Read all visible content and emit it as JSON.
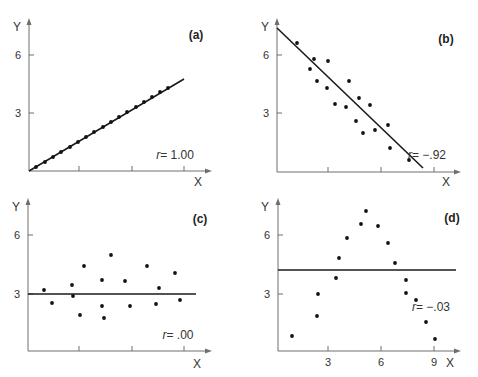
{
  "chart_data": [
    {
      "id": "a",
      "type": "scatter",
      "panel_label": "(a)",
      "xlabel": "X",
      "ylabel": "Y",
      "yticks": [
        "3",
        "6"
      ],
      "xticks": [
        "",
        "",
        ""
      ],
      "r_label": "r",
      "r_value": "= 1.00",
      "correlation": 1.0,
      "fit_line": {
        "x": [
          0,
          8.8
        ],
        "y": [
          0,
          4.75
        ]
      },
      "points": {
        "x": [
          0.4,
          0.9,
          1.4,
          1.9,
          2.4,
          2.9,
          3.4,
          3.9,
          4.4,
          4.9,
          5.4,
          5.9,
          6.4,
          6.9,
          7.4,
          7.9
        ],
        "y": [
          0.2,
          0.5,
          0.75,
          1.0,
          1.3,
          1.55,
          1.8,
          2.1,
          2.35,
          2.6,
          2.9,
          3.15,
          3.4,
          3.7,
          3.95,
          4.2
        ]
      },
      "geom": {
        "ox": 29,
        "oy": 171,
        "xaxis_end": 212,
        "yaxis_top": 18,
        "xtick_px": [
          79,
          132,
          184
        ],
        "ytick_px": [
          113,
          55
        ],
        "line": [
          29,
          171,
          184,
          79
        ],
        "dots": [
          [
            36,
            167
          ],
          [
            45,
            162
          ],
          [
            53,
            157
          ],
          [
            61,
            152
          ],
          [
            70,
            147
          ],
          [
            78,
            142
          ],
          [
            86,
            137
          ],
          [
            94,
            132
          ],
          [
            103,
            127
          ],
          [
            111,
            122
          ],
          [
            119,
            117
          ],
          [
            127,
            112
          ],
          [
            136,
            107
          ],
          [
            144,
            102
          ],
          [
            152,
            97
          ],
          [
            160,
            92
          ],
          [
            168,
            88
          ]
        ],
        "panel_label_xy": [
          196,
          39
        ],
        "r_xy": [
          175,
          159
        ],
        "xlabel_xy": [
          198,
          186
        ],
        "ylabel_xy": [
          17,
          31
        ]
      }
    },
    {
      "id": "b",
      "type": "scatter",
      "panel_label": "(b)",
      "xlabel": "X",
      "ylabel": "Y",
      "yticks": [
        "3",
        "6"
      ],
      "xticks": [
        "",
        "",
        ""
      ],
      "r_label": "r",
      "r_value": "= −.92",
      "correlation": -0.92,
      "fit_line": {
        "x": [
          0,
          8.6
        ],
        "y": [
          7.4,
          0.4
        ]
      },
      "points": {
        "x": [
          1.1,
          2.1,
          1.8,
          2.8,
          2.3,
          2.8,
          4.1,
          3.2,
          3.8,
          4.6,
          4.5,
          5.2,
          5.0,
          5.6,
          6.6,
          6.7,
          7.7
        ],
        "y": [
          6.6,
          5.8,
          5.3,
          5.7,
          4.7,
          4.3,
          4.7,
          3.5,
          3.3,
          3.8,
          2.6,
          3.4,
          2.0,
          2.2,
          2.4,
          1.2,
          0.6
        ]
      },
      "geom": {
        "ox": 277,
        "oy": 172,
        "xaxis_end": 461,
        "yaxis_top": 18,
        "xtick_px": [
          328,
          381,
          434
        ],
        "ytick_px": [
          113,
          55
        ],
        "line": [
          277,
          28,
          423,
          168
        ],
        "dots": [
          [
            297,
            43
          ],
          [
            314,
            59
          ],
          [
            310,
            69
          ],
          [
            328,
            61
          ],
          [
            317,
            81
          ],
          [
            327,
            88
          ],
          [
            349,
            81
          ],
          [
            335,
            104
          ],
          [
            346,
            107
          ],
          [
            359,
            98
          ],
          [
            356,
            121
          ],
          [
            370,
            105
          ],
          [
            363,
            133
          ],
          [
            375,
            130
          ],
          [
            388,
            125
          ],
          [
            390,
            148
          ],
          [
            409,
            160
          ]
        ],
        "panel_label_xy": [
          446,
          43
        ],
        "r_xy": [
          427,
          159
        ],
        "xlabel_xy": [
          446,
          186
        ],
        "ylabel_xy": [
          265,
          31
        ]
      }
    },
    {
      "id": "c",
      "type": "scatter",
      "panel_label": "(c)",
      "xlabel": "X",
      "ylabel": "Y",
      "yticks": [
        "3",
        "6"
      ],
      "xticks": [
        "",
        "",
        ""
      ],
      "r_label": "r",
      "r_value": "= .00",
      "correlation": 0.0,
      "fit_line": {
        "x": [
          0,
          9.5
        ],
        "y": [
          3.0,
          3.0
        ]
      },
      "points": {
        "x": [
          0.9,
          1.3,
          2.5,
          2.5,
          2.9,
          2.8,
          4.0,
          4.0,
          4.1,
          4.5,
          5.3,
          5.5,
          6.5,
          7.0,
          7.2,
          8.1,
          8.5
        ],
        "y": [
          3.2,
          2.5,
          3.5,
          2.9,
          4.4,
          1.9,
          3.7,
          2.4,
          1.8,
          5.0,
          3.7,
          2.4,
          4.4,
          2.5,
          3.3,
          4.0,
          2.7
        ]
      },
      "geom": {
        "ox": 28,
        "oy": 351,
        "xaxis_end": 212,
        "yaxis_top": 198,
        "xtick_px": [
          79,
          132,
          184
        ],
        "ytick_px": [
          294,
          235
        ],
        "line": [
          28,
          294,
          196,
          294
        ],
        "dots": [
          [
            44,
            290
          ],
          [
            52,
            303
          ],
          [
            72,
            285
          ],
          [
            73,
            296
          ],
          [
            84,
            266
          ],
          [
            80,
            315
          ],
          [
            102,
            280
          ],
          [
            102,
            306
          ],
          [
            104,
            318
          ],
          [
            111,
            255
          ],
          [
            125,
            281
          ],
          [
            130,
            306
          ],
          [
            147,
            266
          ],
          [
            156,
            304
          ],
          [
            159,
            288
          ],
          [
            175,
            273
          ],
          [
            180,
            300
          ]
        ],
        "panel_label_xy": [
          200,
          223
        ],
        "r_xy": [
          178,
          339
        ],
        "xlabel_xy": [
          197,
          368
        ],
        "ylabel_xy": [
          16,
          211
        ]
      }
    },
    {
      "id": "d",
      "type": "scatter",
      "panel_label": "(d)",
      "xlabel": "X",
      "ylabel": "Y",
      "yticks": [
        "3",
        "6"
      ],
      "xticks": [
        "3",
        "6",
        "9"
      ],
      "r_label": "r",
      "r_value": "= −.03",
      "correlation": -0.03,
      "fit_line": {
        "x": [
          0,
          10
        ],
        "y": [
          4.4,
          4.4
        ]
      },
      "points": {
        "x": [
          0.8,
          2.2,
          2.3,
          3.4,
          3.6,
          4.0,
          4.8,
          5.1,
          5.7,
          6.3,
          6.7,
          7.3,
          7.3,
          7.9,
          8.5,
          9.0
        ],
        "y": [
          0.8,
          1.8,
          3.0,
          4.0,
          5.0,
          5.8,
          6.6,
          7.3,
          6.5,
          5.6,
          4.6,
          3.8,
          3.1,
          2.8,
          1.6,
          0.6
        ]
      },
      "geom": {
        "ox": 278,
        "oy": 351,
        "xaxis_end": 461,
        "yaxis_top": 198,
        "xtick_px": [
          328,
          381,
          434
        ],
        "ytick_px": [
          294,
          235
        ],
        "line": [
          278,
          270,
          456,
          270
        ],
        "dots": [
          [
            292,
            336
          ],
          [
            317,
            316
          ],
          [
            318,
            294
          ],
          [
            336,
            278
          ],
          [
            339,
            258
          ],
          [
            347,
            238
          ],
          [
            361,
            224
          ],
          [
            366,
            211
          ],
          [
            378,
            226
          ],
          [
            388,
            243
          ],
          [
            395,
            263
          ],
          [
            406,
            280
          ],
          [
            406,
            293
          ],
          [
            416,
            300
          ],
          [
            426,
            322
          ],
          [
            435,
            339
          ]
        ],
        "panel_label_xy": [
          452,
          222
        ],
        "r_xy": [
          431,
          311
        ],
        "xlabel_xy": [
          450,
          367
        ],
        "ylabel_xy": [
          265,
          211
        ]
      }
    }
  ]
}
